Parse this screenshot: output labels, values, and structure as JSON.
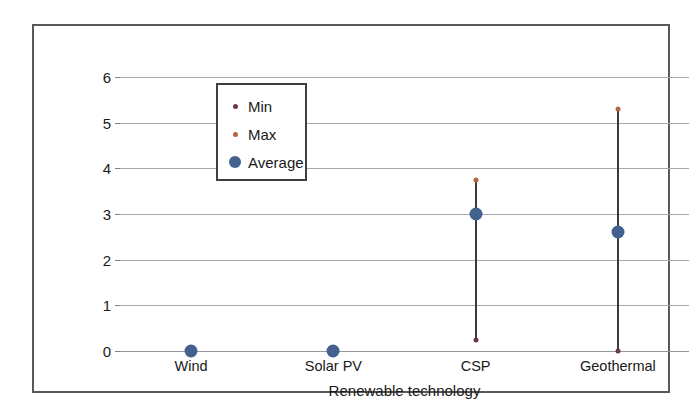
{
  "chart_data": {
    "type": "scatter",
    "title": "",
    "xlabel": "Renewable technology",
    "ylabel": "Water consumption (l/kWh)",
    "categories": [
      "Wind",
      "Solar PV",
      "CSP",
      "Geothermal"
    ],
    "ylim": [
      0,
      6
    ],
    "yticks": [
      "0",
      "1",
      "2",
      "3",
      "4",
      "5",
      "6"
    ],
    "grid": true,
    "legend_position": "upper-left-inside",
    "series": [
      {
        "name": "Min",
        "marker": "small-dot",
        "color": "#6b3a3f",
        "values": [
          0,
          0,
          0.25,
          0
        ]
      },
      {
        "name": "Max",
        "marker": "small-dot",
        "color": "#b4653f",
        "values": [
          0,
          0,
          3.75,
          5.3
        ]
      },
      {
        "name": "Average",
        "marker": "large-dot",
        "color": "#43618f",
        "values": [
          0,
          0,
          3.0,
          2.6
        ]
      }
    ],
    "range_bars": [
      {
        "category": "Wind",
        "low": 0,
        "high": 0,
        "visible": false
      },
      {
        "category": "Solar PV",
        "low": 0,
        "high": 0,
        "visible": false
      },
      {
        "category": "CSP",
        "low": 0.25,
        "high": 3.75,
        "visible": true
      },
      {
        "category": "Geothermal",
        "low": 0,
        "high": 5.3,
        "visible": true
      }
    ],
    "range_line_color": "#3b3b3b"
  },
  "legend": {
    "entries": [
      {
        "label": "Min",
        "icon": "small-dot-marker-icon"
      },
      {
        "label": "Max",
        "icon": "small-dot-marker-icon"
      },
      {
        "label": "Average",
        "icon": "large-dot-marker-icon"
      }
    ]
  },
  "axes": {
    "y_title": "Water consumption (l/kWh)",
    "x_title": "Renewable technology",
    "y_tick_labels": [
      "6",
      "5",
      "4",
      "3",
      "2",
      "1",
      "0"
    ],
    "x_tick_labels": [
      "Wind",
      "Solar PV",
      "CSP",
      "Geothermal"
    ]
  },
  "colors": {
    "min": "#6b3a3f",
    "max": "#b4653f",
    "average": "#43618f",
    "grid": "#a7a9ac",
    "frame": "#58595b",
    "text": "#1a1a1a"
  }
}
